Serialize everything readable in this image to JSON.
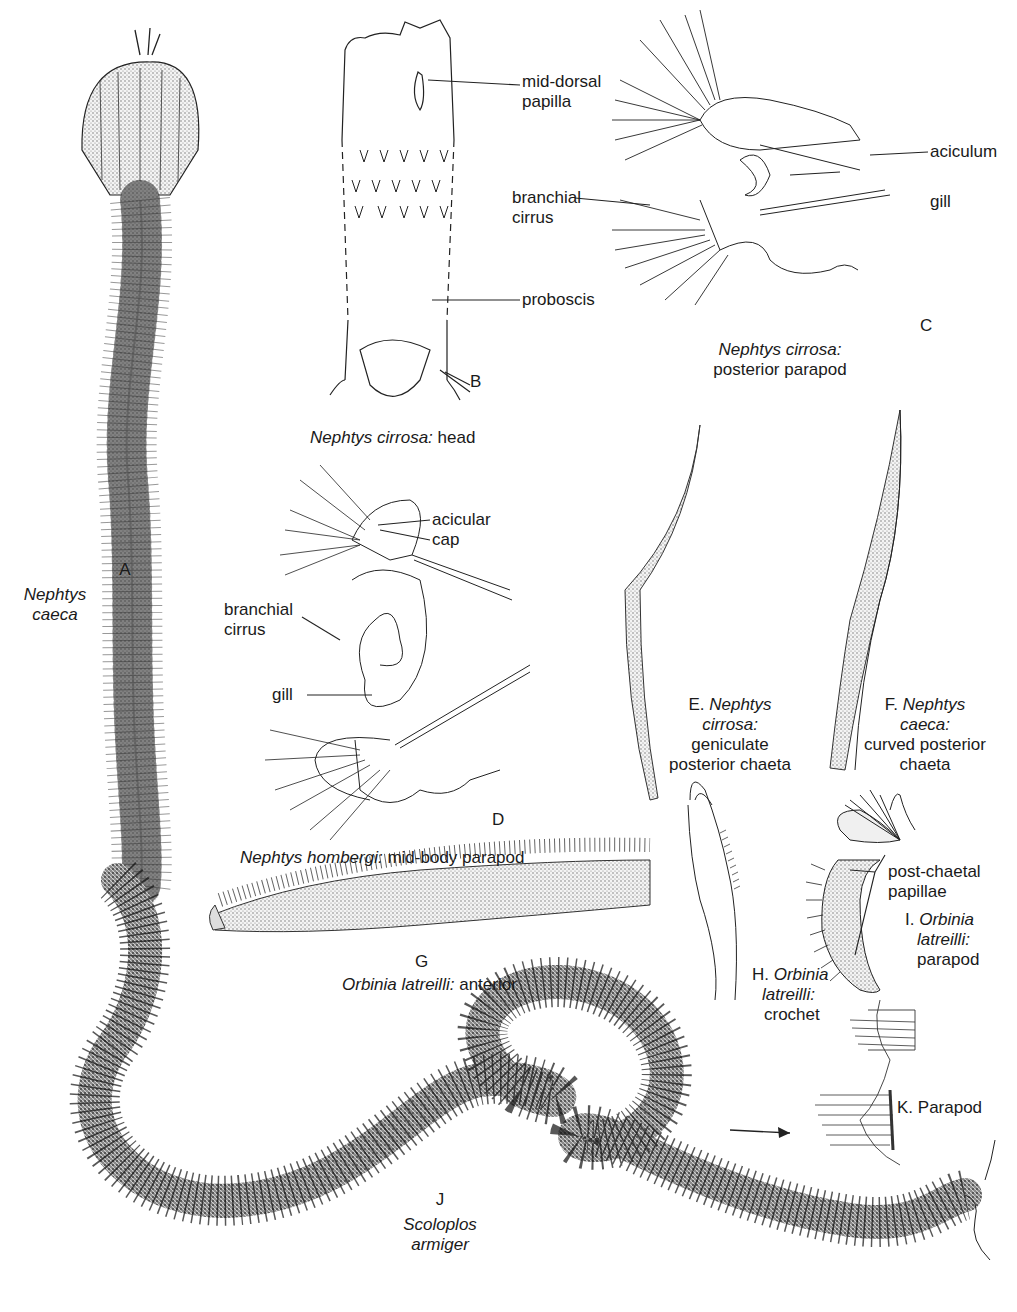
{
  "figures": {
    "A": {
      "letter": "A",
      "species_line1": "Nephtys",
      "species_line2": "caeca"
    },
    "B": {
      "letter": "B",
      "species": "Nephtys cirrosa:",
      "part": "head",
      "callouts": {
        "mid_dorsal_1": "mid-dorsal",
        "mid_dorsal_2": "papilla",
        "proboscis": "proboscis"
      }
    },
    "C": {
      "letter": "C",
      "species": "Nephtys cirrosa:",
      "part": "posterior parapod",
      "callouts": {
        "aciculum": "aciculum",
        "gill": "gill",
        "branchial_1": "branchial",
        "branchial_2": "cirrus"
      }
    },
    "D": {
      "letter": "D",
      "species": "Nephtys hombergi:",
      "part": "mid-body parapod",
      "callouts": {
        "acicular_1": "acicular",
        "acicular_2": "cap",
        "branchial_1": "branchial",
        "branchial_2": "cirrus",
        "gill": "gill"
      }
    },
    "E": {
      "prefix": "E.",
      "species_1": "Nephtys",
      "species_2": "cirrosa:",
      "desc_1": "geniculate",
      "desc_2": "posterior chaeta"
    },
    "F": {
      "prefix": "F.",
      "species_1": "Nephtys",
      "species_2": "caeca:",
      "desc_1": "curved posterior",
      "desc_2": "chaeta"
    },
    "G": {
      "letter": "G",
      "species": "Orbinia latreilli:",
      "part": "anterior"
    },
    "H": {
      "prefix": "H.",
      "species_1": "Orbinia",
      "species_2": "latreilli:",
      "desc_1": "crochet"
    },
    "I": {
      "prefix": "I.",
      "species_1": "Orbinia",
      "species_2": "latreilli:",
      "desc_1": "parapod",
      "callouts": {
        "post_chaetal_1": "post-chaetal",
        "post_chaetal_2": "papillae"
      }
    },
    "J": {
      "letter": "J",
      "species_1": "Scoloplos",
      "species_2": "armiger"
    },
    "K": {
      "prefix": "K.",
      "desc": "Parapod"
    }
  },
  "colors": {
    "ink": "#1a1a1a",
    "background": "#ffffff",
    "stipple": "#555555"
  }
}
